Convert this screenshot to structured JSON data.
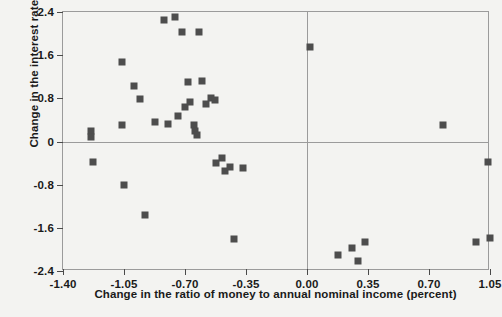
{
  "chart_data": {
    "type": "scatter",
    "title": "",
    "xlabel": "Change in the ratio of money to annual nominal income (percent)",
    "ylabel": "Change in the interest rate (percent)",
    "xlim": [
      -1.4,
      1.05
    ],
    "ylim": [
      -2.4,
      2.4
    ],
    "xticks": [
      -1.4,
      -1.05,
      -0.7,
      -0.35,
      0.0,
      0.35,
      0.7,
      1.05
    ],
    "xticklabels": [
      "-1.40",
      "-1.05",
      "-0.70",
      "-0.35",
      "0.00",
      "0.35",
      "0.70",
      "1.05"
    ],
    "yticks": [
      2.4,
      1.6,
      0.8,
      0,
      -0.8,
      -1.6,
      -2.4
    ],
    "yticklabels": [
      "2.4",
      "1.6",
      "0.8",
      "0",
      "-0.8",
      "-1.6",
      "-2.4"
    ],
    "grid": false,
    "legend": null,
    "reference_lines": {
      "vertical_x": 0.0,
      "horizontal_y": 0.0
    },
    "marker": {
      "shape": "square",
      "color": "#4d4d4d",
      "size": 7
    },
    "series": [
      {
        "name": "observations",
        "points": [
          [
            -1.24,
            0.2
          ],
          [
            -1.24,
            0.08
          ],
          [
            -1.23,
            -0.38
          ],
          [
            -1.06,
            1.48
          ],
          [
            -1.06,
            0.3
          ],
          [
            -1.05,
            -0.8
          ],
          [
            -0.99,
            1.02
          ],
          [
            -0.96,
            0.78
          ],
          [
            -0.93,
            -1.36
          ],
          [
            -0.87,
            0.36
          ],
          [
            -0.82,
            2.25
          ],
          [
            -0.8,
            0.33
          ],
          [
            -0.76,
            2.3
          ],
          [
            -0.74,
            0.47
          ],
          [
            -0.72,
            2.03
          ],
          [
            -0.7,
            0.64
          ],
          [
            -0.68,
            1.1
          ],
          [
            -0.67,
            0.73
          ],
          [
            -0.65,
            0.3
          ],
          [
            -0.64,
            0.2
          ],
          [
            -0.63,
            0.12
          ],
          [
            -0.62,
            2.03
          ],
          [
            -0.6,
            1.12
          ],
          [
            -0.58,
            0.7
          ],
          [
            -0.55,
            0.81
          ],
          [
            -0.53,
            0.76
          ],
          [
            -0.52,
            -0.4
          ],
          [
            -0.49,
            -0.3
          ],
          [
            -0.47,
            -0.55
          ],
          [
            -0.44,
            -0.47
          ],
          [
            -0.42,
            -1.8
          ],
          [
            -0.37,
            -0.5
          ],
          [
            0.02,
            1.76
          ],
          [
            0.18,
            -2.1
          ],
          [
            0.26,
            -1.98
          ],
          [
            0.29,
            -2.22
          ],
          [
            0.33,
            -1.86
          ],
          [
            0.78,
            0.3
          ],
          [
            0.97,
            -1.86
          ],
          [
            1.04,
            -0.38
          ],
          [
            1.05,
            -1.78
          ]
        ]
      }
    ]
  }
}
